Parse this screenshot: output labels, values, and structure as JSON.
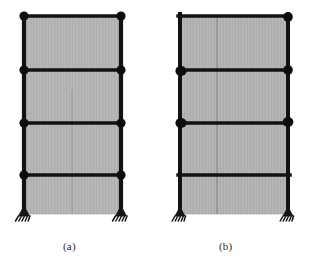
{
  "figure": {
    "kind": "structural-frame-plastic-hinge-diagram",
    "background_color": "#ffffff",
    "panel_fill_color": "#b5b5b5",
    "panel_edge_color": "#9d9d9d",
    "member_color": "#121212",
    "hinge_color": "#0d0d0d",
    "support_color": "#151515",
    "divider_color": "#7a7a7a"
  },
  "subfigures": [
    {
      "id": "a",
      "caption": "(a)",
      "geometry": {
        "left_column_x": 24,
        "right_column_x": 121,
        "top_y": 16,
        "base_y": 214,
        "mid_divider": false,
        "beam_levels_y": [
          16,
          70,
          123,
          175
        ],
        "storey_count": 4
      },
      "hinges": [
        {
          "x": 24,
          "y": 16,
          "r": 4.6
        },
        {
          "x": 121,
          "y": 16,
          "r": 4.6
        },
        {
          "x": 24,
          "y": 70,
          "r": 4.6
        },
        {
          "x": 121,
          "y": 70,
          "r": 4.6
        },
        {
          "x": 24,
          "y": 123,
          "r": 4.6
        },
        {
          "x": 121,
          "y": 123,
          "r": 4.6
        },
        {
          "x": 24,
          "y": 175,
          "r": 4.6
        },
        {
          "x": 121,
          "y": 175,
          "r": 4.6
        }
      ],
      "supports": [
        {
          "x": 24,
          "y": 214,
          "type": "pinned-hatched"
        },
        {
          "x": 121,
          "y": 214,
          "type": "pinned-hatched"
        }
      ],
      "hinge_count": 8
    },
    {
      "id": "b",
      "caption": "(b)",
      "geometry": {
        "left_column_x": 180,
        "right_column_x": 288,
        "top_y": 16,
        "base_y": 214,
        "mid_divider": true,
        "mid_divider_x": 217,
        "beam_levels_y": [
          16,
          70,
          123,
          175
        ],
        "storey_count": 4
      },
      "hinges": [
        {
          "x": 288,
          "y": 17,
          "r": 4.8
        },
        {
          "x": 180,
          "y": 70,
          "r": 5.4
        },
        {
          "x": 288,
          "y": 70,
          "r": 4.8
        },
        {
          "x": 180,
          "y": 123,
          "r": 5.4
        },
        {
          "x": 288,
          "y": 123,
          "r": 5.4
        }
      ],
      "supports": [
        {
          "x": 180,
          "y": 214,
          "type": "pinned-hatched"
        },
        {
          "x": 288,
          "y": 214,
          "type": "pinned-hatched"
        }
      ],
      "hinge_count": 5
    }
  ]
}
